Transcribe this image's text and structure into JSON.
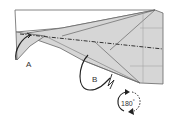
{
  "diagram": {
    "type": "origami-instruction-step",
    "labels": {
      "flap_a": "A",
      "flap_b": "B",
      "rotation": "180",
      "rotation_unit": "°"
    },
    "colors": {
      "paper_white": "#ffffff",
      "paper_shaded": "#d4d4d4",
      "line": "#555555",
      "arrow": "#222222"
    },
    "elements": [
      {
        "name": "white-top-layer",
        "description": "white triangular paper layer at top"
      },
      {
        "name": "shaded-model-body",
        "description": "grey shaded folded body with crease grid"
      },
      {
        "name": "mountain-fold-line",
        "description": "dash-dot horizontal mountain fold line"
      },
      {
        "name": "flap-a-arrow",
        "description": "curved fold arrow at flap A"
      },
      {
        "name": "flap-b-arrow",
        "description": "looping fold arrow at flap B"
      },
      {
        "name": "rotate-180-symbol",
        "description": "circular arrow indicating turn model 180 degrees"
      }
    ]
  }
}
